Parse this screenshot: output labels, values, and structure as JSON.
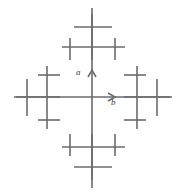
{
  "figure": {
    "background_color": "#ffffff",
    "stroke_color": "#6b6b6b",
    "axis_color": "#6b6b6b",
    "label_color": "#3a3a3a",
    "stroke_width": 1.6,
    "width": 184,
    "height": 194
  },
  "axes": {
    "origin": {
      "x": 92,
      "y": 97
    },
    "vertical": {
      "name": "a",
      "label": "a",
      "arrow_direction": "up",
      "label_position": {
        "x": 76,
        "y": 68
      },
      "line": {
        "x1": 92,
        "y1": 8,
        "x2": 92,
        "y2": 188
      },
      "arrow_tip": {
        "x": 92,
        "y": 70
      }
    },
    "horizontal": {
      "name": "b",
      "label": "b",
      "arrow_direction": "right",
      "label_position": {
        "x": 111,
        "y": 98
      },
      "line": {
        "x1": 16,
        "y1": 97,
        "x2": 172,
        "y2": 97
      },
      "arrow_tip": {
        "x": 115,
        "y": 97
      }
    }
  },
  "clusters": [
    {
      "name": "top-motif",
      "position": "top",
      "center": {
        "x": 92,
        "y": 40
      },
      "segments": [
        {
          "type": "horizontal",
          "x1": 62,
          "y1": 47,
          "x2": 125,
          "y2": 47
        },
        {
          "type": "horizontal",
          "x1": 74,
          "y1": 27,
          "x2": 112,
          "y2": 27
        },
        {
          "type": "vertical",
          "x1": 70,
          "y1": 38,
          "x2": 70,
          "y2": 60
        },
        {
          "type": "vertical",
          "x1": 115,
          "y1": 38,
          "x2": 115,
          "y2": 60
        },
        {
          "type": "vertical",
          "x1": 92,
          "y1": 14,
          "x2": 92,
          "y2": 60
        }
      ]
    },
    {
      "name": "bottom-motif",
      "position": "bottom",
      "center": {
        "x": 92,
        "y": 154
      },
      "segments": [
        {
          "type": "horizontal",
          "x1": 62,
          "y1": 147,
          "x2": 125,
          "y2": 147
        },
        {
          "type": "horizontal",
          "x1": 74,
          "y1": 167,
          "x2": 112,
          "y2": 167
        },
        {
          "type": "vertical",
          "x1": 70,
          "y1": 134,
          "x2": 70,
          "y2": 156
        },
        {
          "type": "vertical",
          "x1": 115,
          "y1": 134,
          "x2": 115,
          "y2": 156
        },
        {
          "type": "vertical",
          "x1": 92,
          "y1": 134,
          "x2": 92,
          "y2": 180
        }
      ]
    },
    {
      "name": "left-motif",
      "position": "left",
      "center": {
        "x": 40,
        "y": 97
      },
      "segments": [
        {
          "type": "vertical",
          "x1": 47,
          "y1": 66,
          "x2": 47,
          "y2": 129
        },
        {
          "type": "vertical",
          "x1": 27,
          "y1": 79,
          "x2": 27,
          "y2": 116
        },
        {
          "type": "horizontal",
          "x1": 38,
          "y1": 75,
          "x2": 60,
          "y2": 75
        },
        {
          "type": "horizontal",
          "x1": 38,
          "y1": 120,
          "x2": 60,
          "y2": 120
        },
        {
          "type": "horizontal",
          "x1": 14,
          "y1": 97,
          "x2": 60,
          "y2": 97
        }
      ]
    },
    {
      "name": "right-motif",
      "position": "right",
      "center": {
        "x": 144,
        "y": 97
      },
      "segments": [
        {
          "type": "vertical",
          "x1": 137,
          "y1": 66,
          "x2": 137,
          "y2": 129
        },
        {
          "type": "vertical",
          "x1": 157,
          "y1": 79,
          "x2": 157,
          "y2": 116
        },
        {
          "type": "horizontal",
          "x1": 124,
          "y1": 75,
          "x2": 146,
          "y2": 75
        },
        {
          "type": "horizontal",
          "x1": 124,
          "y1": 120,
          "x2": 146,
          "y2": 120
        },
        {
          "type": "horizontal",
          "x1": 124,
          "y1": 97,
          "x2": 170,
          "y2": 97
        }
      ]
    }
  ]
}
